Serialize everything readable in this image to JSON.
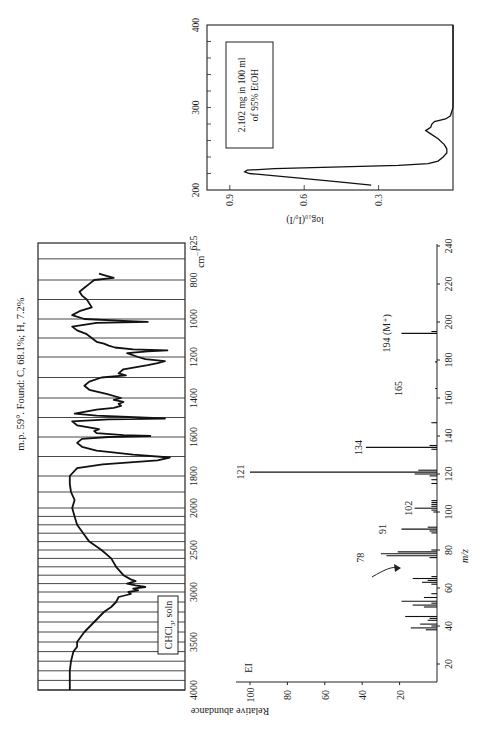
{
  "page": {
    "orientation": "rotated-90-ccw",
    "header_note": "m.p. 59°. Found: C, 68.1%; H, 7.2%"
  },
  "chart_data": [
    {
      "id": "ir",
      "type": "line",
      "title": "IR spectrum",
      "xlabel": "cm⁻¹",
      "ylabel": "Transmittance",
      "x_ticks": [
        "4000",
        "3500",
        "3000",
        "2500",
        "2000",
        "1800",
        "1600",
        "1400",
        "1200",
        "1000",
        "800",
        "625"
      ],
      "x_unit": "cm⁻¹",
      "annotation": "CHCl₃ soln",
      "grid": true,
      "points": [
        [
          4000,
          8
        ],
        [
          3900,
          8
        ],
        [
          3800,
          8
        ],
        [
          3700,
          9
        ],
        [
          3600,
          11
        ],
        [
          3550,
          14
        ],
        [
          3500,
          14
        ],
        [
          3450,
          17
        ],
        [
          3400,
          20
        ],
        [
          3300,
          28
        ],
        [
          3200,
          36
        ],
        [
          3150,
          42
        ],
        [
          3100,
          46
        ],
        [
          3050,
          48
        ],
        [
          3020,
          58
        ],
        [
          3000,
          56
        ],
        [
          2980,
          64
        ],
        [
          2960,
          60
        ],
        [
          2940,
          70
        ],
        [
          2920,
          62
        ],
        [
          2900,
          55
        ],
        [
          2870,
          62
        ],
        [
          2850,
          58
        ],
        [
          2800,
          52
        ],
        [
          2700,
          46
        ],
        [
          2600,
          42
        ],
        [
          2500,
          34
        ],
        [
          2400,
          24
        ],
        [
          2300,
          19
        ],
        [
          2200,
          14
        ],
        [
          2100,
          12
        ],
        [
          2000,
          10
        ],
        [
          1950,
          12
        ],
        [
          1900,
          9
        ],
        [
          1850,
          8
        ],
        [
          1800,
          8
        ],
        [
          1760,
          14
        ],
        [
          1740,
          35
        ],
        [
          1720,
          80
        ],
        [
          1705,
          90
        ],
        [
          1690,
          60
        ],
        [
          1670,
          30
        ],
        [
          1650,
          18
        ],
        [
          1630,
          14
        ],
        [
          1610,
          18
        ],
        [
          1600,
          40
        ],
        [
          1595,
          74
        ],
        [
          1590,
          52
        ],
        [
          1580,
          30
        ],
        [
          1570,
          28
        ],
        [
          1560,
          32
        ],
        [
          1540,
          14
        ],
        [
          1520,
          10
        ],
        [
          1510,
          40
        ],
        [
          1505,
          86
        ],
        [
          1500,
          66
        ],
        [
          1490,
          30
        ],
        [
          1480,
          12
        ],
        [
          1460,
          30
        ],
        [
          1450,
          44
        ],
        [
          1440,
          50
        ],
        [
          1430,
          48
        ],
        [
          1420,
          52
        ],
        [
          1410,
          44
        ],
        [
          1400,
          50
        ],
        [
          1380,
          38
        ],
        [
          1360,
          24
        ],
        [
          1340,
          20
        ],
        [
          1320,
          24
        ],
        [
          1300,
          34
        ],
        [
          1290,
          54
        ],
        [
          1280,
          48
        ],
        [
          1260,
          52
        ],
        [
          1240,
          72
        ],
        [
          1230,
          80
        ],
        [
          1220,
          86
        ],
        [
          1210,
          70
        ],
        [
          1200,
          64
        ],
        [
          1180,
          55
        ],
        [
          1170,
          72
        ],
        [
          1165,
          88
        ],
        [
          1160,
          60
        ],
        [
          1150,
          45
        ],
        [
          1140,
          40
        ],
        [
          1130,
          36
        ],
        [
          1120,
          30
        ],
        [
          1100,
          26
        ],
        [
          1080,
          22
        ],
        [
          1060,
          14
        ],
        [
          1040,
          10
        ],
        [
          1020,
          30
        ],
        [
          1015,
          72
        ],
        [
          1010,
          52
        ],
        [
          1000,
          20
        ],
        [
          980,
          10
        ],
        [
          960,
          16
        ],
        [
          940,
          26
        ],
        [
          920,
          24
        ],
        [
          900,
          22
        ],
        [
          880,
          18
        ],
        [
          860,
          16
        ],
        [
          840,
          20
        ],
        [
          820,
          24
        ],
        [
          800,
          28
        ],
        [
          790,
          44
        ],
        [
          780,
          38
        ],
        [
          770,
          32
        ]
      ]
    },
    {
      "id": "ms",
      "type": "bar",
      "title": "Mass spectrum (EI)",
      "xlabel": "m/z",
      "ylabel": "Relative abundance",
      "annotation": "EI",
      "x_ticks": [
        "20",
        "40",
        "60",
        "80",
        "100",
        "120",
        "140",
        "160",
        "180",
        "200",
        "220",
        "240"
      ],
      "y_ticks": [
        "20",
        "40",
        "60",
        "80",
        "100"
      ],
      "xlim": [
        10,
        240
      ],
      "ylim": [
        0,
        100
      ],
      "labeled_peaks": [
        "78",
        "91",
        "102",
        "121",
        "134",
        "165",
        "194 (M⁺)"
      ],
      "peaks": [
        [
          38,
          6
        ],
        [
          39,
          14
        ],
        [
          40,
          3
        ],
        [
          41,
          9
        ],
        [
          43,
          5
        ],
        [
          44,
          4
        ],
        [
          45,
          17
        ],
        [
          50,
          7
        ],
        [
          51,
          13
        ],
        [
          52,
          3
        ],
        [
          53,
          19
        ],
        [
          55,
          7
        ],
        [
          57,
          3
        ],
        [
          62,
          3
        ],
        [
          63,
          8
        ],
        [
          64,
          5
        ],
        [
          65,
          13
        ],
        [
          66,
          3
        ],
        [
          76,
          4
        ],
        [
          77,
          27
        ],
        [
          78,
          30
        ],
        [
          79,
          21
        ],
        [
          80,
          3
        ],
        [
          89,
          3
        ],
        [
          90,
          4
        ],
        [
          91,
          19
        ],
        [
          92,
          5
        ],
        [
          100,
          2
        ],
        [
          101,
          3
        ],
        [
          102,
          12
        ],
        [
          103,
          3
        ],
        [
          104,
          3
        ],
        [
          105,
          3
        ],
        [
          106,
          3
        ],
        [
          115,
          3
        ],
        [
          117,
          3
        ],
        [
          119,
          4
        ],
        [
          120,
          12
        ],
        [
          121,
          100
        ],
        [
          122,
          10
        ],
        [
          133,
          3
        ],
        [
          134,
          38
        ],
        [
          135,
          4
        ],
        [
          147,
          3
        ],
        [
          165,
          1
        ],
        [
          179,
          1
        ],
        [
          194,
          19
        ],
        [
          195,
          3
        ]
      ]
    },
    {
      "id": "uv",
      "type": "line",
      "title": "UV spectrum",
      "xlabel": "nm",
      "ylabel": "log10(I0/I)",
      "x_ticks": [
        "200",
        "300",
        "400"
      ],
      "y_ticks": [
        "0.3",
        "0.6",
        "0.9"
      ],
      "xlim": [
        200,
        400
      ],
      "ylim": [
        0,
        1.0
      ],
      "annotation": "2.102 mg in 100 ml of 95% EtOH",
      "points": [
        [
          206,
          0.33
        ],
        [
          210,
          0.46
        ],
        [
          215,
          0.64
        ],
        [
          220,
          0.82
        ],
        [
          222,
          0.84
        ],
        [
          224,
          0.83
        ],
        [
          226,
          0.72
        ],
        [
          228,
          0.45
        ],
        [
          230,
          0.22
        ],
        [
          232,
          0.1
        ],
        [
          235,
          0.06
        ],
        [
          240,
          0.04
        ],
        [
          245,
          0.025
        ],
        [
          250,
          0.025
        ],
        [
          255,
          0.035
        ],
        [
          262,
          0.06
        ],
        [
          268,
          0.09
        ],
        [
          272,
          0.11
        ],
        [
          276,
          0.09
        ],
        [
          280,
          0.085
        ],
        [
          283,
          0.075
        ],
        [
          286,
          0.03
        ],
        [
          290,
          0.01
        ],
        [
          300,
          0.0
        ],
        [
          320,
          0.0
        ],
        [
          400,
          0.0
        ]
      ]
    }
  ],
  "labels": {
    "ir_unit": "cm",
    "ir_unit_sup": "−1",
    "ir_solvent": "CHCl",
    "ir_solvent_sub": "3",
    "ir_solvent_tail": ", soln",
    "ms_mode": "EI",
    "ms_xlabel": "m/z",
    "ms_ylabel": "Relative abundance",
    "ms_peak_labels": {
      "p78": "78",
      "p91": "91",
      "p102": "102",
      "p121": "121",
      "p134": "134",
      "p165": "165",
      "p194": "194 (M⁺)"
    },
    "uv_note_line1": "2.102 mg  in 100 ml",
    "uv_note_line2": "of 95% EtOH",
    "uv_ylabel": "log₁₀(I₀/I)"
  }
}
